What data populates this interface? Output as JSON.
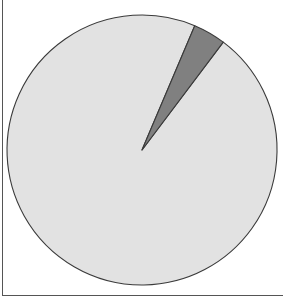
{
  "figure": {
    "title": "",
    "background_color": "#ffffff",
    "frame_color": "#555555",
    "width": 285,
    "height": 302
  },
  "pie": {
    "center_x": 142,
    "center_y": 150,
    "radius": 135,
    "start_angle_deg": 23,
    "outline_color": "#3a3a3a",
    "outline_width": 1.1
  },
  "chart_data": {
    "type": "pie",
    "title": "",
    "labels": [
      "Slice 1",
      "Slice 2"
    ],
    "values": [
      96.1,
      3.9
    ],
    "percentages": [
      "96.1%",
      "3.9%"
    ],
    "colors": [
      "#e2e2e2",
      "#808080"
    ],
    "startangle": 67,
    "counterclock": false,
    "legend": false,
    "show_labels": false,
    "grid": false,
    "slices": [
      {
        "label": "Slice 1",
        "value": 96.1,
        "percent": "96.1%",
        "color": "#e2e2e2",
        "angle_deg": 346,
        "start_deg": 37,
        "end_deg": 383
      },
      {
        "label": "Slice 2",
        "value": 3.9,
        "percent": "3.9%",
        "color": "#808080",
        "angle_deg": 14,
        "start_deg": 23,
        "end_deg": 37
      }
    ]
  }
}
